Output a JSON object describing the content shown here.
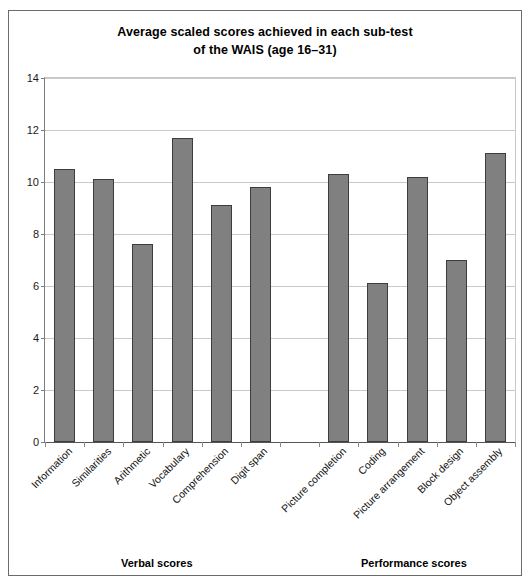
{
  "figure": {
    "title_line1": "Average scaled scores achieved in each sub-test",
    "title_line2": "of the WAIS (age 16–31)",
    "group_captions": {
      "verbal": "Verbal scores",
      "performance": "Performance scores"
    }
  },
  "chart_data": {
    "type": "bar",
    "title": "Average scaled scores achieved in each sub-test of the WAIS (age 16–31)",
    "xlabel": "",
    "ylabel": "",
    "ylim": [
      0,
      14
    ],
    "yticks": [
      0,
      2,
      4,
      6,
      8,
      10,
      12,
      14
    ],
    "ytick_labels": [
      "0",
      "2",
      "4",
      "6",
      "8",
      "10",
      "12",
      "14"
    ],
    "grid": true,
    "legend": null,
    "categories": [
      "Information",
      "Similarities",
      "Arithmetic",
      "Vocabulary",
      "Comprehension",
      "Digit span",
      "Picture completion",
      "Coding",
      "Picture arrangement",
      "Block design",
      "Object assembly"
    ],
    "values": [
      10.5,
      10.1,
      7.6,
      11.7,
      9.1,
      9.8,
      10.3,
      6.1,
      10.2,
      7.0,
      11.1
    ],
    "groups": [
      {
        "name": "Verbal scores",
        "categories": [
          "Information",
          "Similarities",
          "Arithmetic",
          "Vocabulary",
          "Comprehension",
          "Digit span"
        ]
      },
      {
        "name": "Performance scores",
        "categories": [
          "Picture completion",
          "Coding",
          "Picture arrangement",
          "Block design",
          "Object assembly"
        ]
      }
    ],
    "bar_color": "#808080",
    "bar_edge_color": "#3d3d3d"
  }
}
